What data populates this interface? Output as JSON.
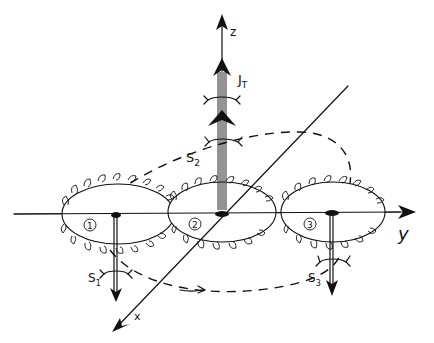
{
  "figure": {
    "axes": {
      "z_label": "z",
      "y_label": "y",
      "x_label": "x"
    },
    "gears": [
      {
        "id": "gear-1",
        "label": "1",
        "spin_label": "S",
        "spin_sub": "1",
        "spin_direction": "down"
      },
      {
        "id": "gear-2",
        "label": "2",
        "spin_label": "S",
        "spin_sub": "2",
        "spin_direction": "up"
      },
      {
        "id": "gear-3",
        "label": "3",
        "spin_label": "S",
        "spin_sub": "3",
        "spin_direction": "down"
      }
    ],
    "total": {
      "label": "J",
      "sub": "T",
      "direction": "up"
    },
    "path": {
      "style": "dashed closed loop",
      "direction_arrow": "right"
    },
    "colors": {
      "ink": "#111111",
      "background": "#ffffff"
    }
  }
}
